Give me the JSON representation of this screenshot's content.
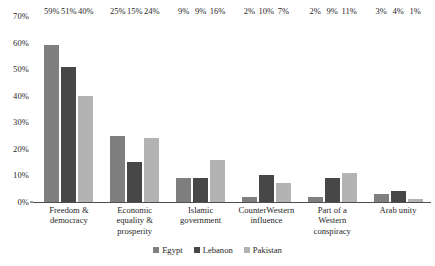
{
  "chart_data": {
    "type": "bar",
    "title": "",
    "subtitle": "",
    "xlabel": "",
    "ylabel": "",
    "ylim": [
      0,
      70
    ],
    "ytick_labels": [
      "0%",
      "10%",
      "20%",
      "30%",
      "40%",
      "50%",
      "60%",
      "70%"
    ],
    "ytick_values": [
      0,
      10,
      20,
      30,
      40,
      50,
      60,
      70
    ],
    "grid": false,
    "legend_position": "bottom",
    "categories": [
      "Freedom & democracy",
      "Economic equality & prosperity",
      "Islamic government",
      "CounterWestern influence",
      "Part of a Western conspiracy",
      "Arab unity"
    ],
    "category_lines": [
      [
        "Freedom &",
        "democracy"
      ],
      [
        "Economic",
        "equality &",
        "prosperity"
      ],
      [
        "Islamic",
        "government"
      ],
      [
        "CounterWestern",
        "influence"
      ],
      [
        "Part of a",
        "Western",
        "conspiracy"
      ],
      [
        "Arab unity"
      ]
    ],
    "series": [
      {
        "name": "Egypt",
        "color": "#7f7f7f",
        "values": [
          59,
          25,
          9,
          2,
          2,
          3
        ],
        "labels": [
          "59%",
          "25%",
          "9%",
          "2%",
          "2%",
          "3%"
        ]
      },
      {
        "name": "Lebanon",
        "color": "#474747",
        "values": [
          51,
          15,
          9,
          10,
          9,
          4
        ],
        "labels": [
          "51%",
          "15%",
          "9%",
          "10%",
          "9%",
          "4%"
        ]
      },
      {
        "name": "Pakistan",
        "color": "#b3b3b3",
        "values": [
          40,
          24,
          16,
          7,
          11,
          1
        ],
        "labels": [
          "40%",
          "24%",
          "16%",
          "7%",
          "11%",
          "1%"
        ]
      }
    ]
  },
  "colors": {
    "egypt": "#7f7f7f",
    "lebanon": "#474747",
    "pakistan": "#b3b3b3",
    "axis": "#4f4f4f",
    "text": "#1f1f1f",
    "background": "#ffffff"
  }
}
